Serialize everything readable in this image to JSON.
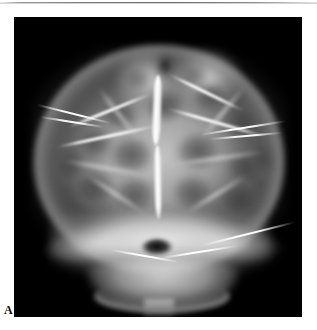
{
  "figure": {
    "panel_label": "A",
    "modality_icon": "xray-icon",
    "panel_background_color": "#000000",
    "page_background_color": "#ffffff",
    "rule_color": "#777777",
    "label_color": "#111111"
  },
  "image": {
    "name": "skull-radiograph",
    "view": "anteroposterior",
    "finding": "lacunar-skull",
    "panel_left_px": 14,
    "panel_top_px": 17,
    "panel_width_px": 288,
    "panel_height_px": 300
  },
  "anatomy": {
    "vault": {
      "name": "cranial-vault"
    },
    "vertex_bumps": {
      "name": "vertex-contour"
    },
    "lacunae": [
      {
        "name": "lacuna-right-upper-1",
        "x": 128,
        "y": 70,
        "w": 46,
        "h": 38,
        "rot": -8,
        "tone": 0.82
      },
      {
        "name": "lacuna-right-upper-2",
        "x": 174,
        "y": 62,
        "w": 44,
        "h": 36,
        "rot": 6,
        "tone": 0.8
      },
      {
        "name": "lacuna-right-lat-1",
        "x": 206,
        "y": 86,
        "w": 44,
        "h": 40,
        "rot": 14,
        "tone": 0.78
      },
      {
        "name": "lacuna-left-upper-1",
        "x": 84,
        "y": 80,
        "w": 44,
        "h": 36,
        "rot": 10,
        "tone": 0.78
      },
      {
        "name": "lacuna-left-upper-2",
        "x": 60,
        "y": 106,
        "w": 42,
        "h": 40,
        "rot": -6,
        "tone": 0.74
      },
      {
        "name": "lacuna-mid-left",
        "x": 92,
        "y": 116,
        "w": 52,
        "h": 44,
        "rot": 4,
        "tone": 0.84
      },
      {
        "name": "lacuna-mid-right",
        "x": 158,
        "y": 112,
        "w": 52,
        "h": 44,
        "rot": -4,
        "tone": 0.84
      },
      {
        "name": "lacuna-right-lat-2",
        "x": 208,
        "y": 128,
        "w": 46,
        "h": 44,
        "rot": -12,
        "tone": 0.8
      },
      {
        "name": "lacuna-left-lower-1",
        "x": 56,
        "y": 150,
        "w": 48,
        "h": 42,
        "rot": 8,
        "tone": 0.8
      },
      {
        "name": "lacuna-mid-low-left",
        "x": 96,
        "y": 156,
        "w": 50,
        "h": 44,
        "rot": -6,
        "tone": 0.8
      },
      {
        "name": "lacuna-mid-low-right",
        "x": 154,
        "y": 154,
        "w": 50,
        "h": 44,
        "rot": 6,
        "tone": 0.8
      },
      {
        "name": "lacuna-right-lower-1",
        "x": 200,
        "y": 160,
        "w": 48,
        "h": 42,
        "rot": -8,
        "tone": 0.78
      },
      {
        "name": "lacuna-left-temporal",
        "x": 38,
        "y": 124,
        "w": 36,
        "h": 46,
        "rot": 16,
        "tone": 0.66
      },
      {
        "name": "lacuna-right-temporal",
        "x": 232,
        "y": 118,
        "w": 34,
        "h": 46,
        "rot": -16,
        "tone": 0.64
      },
      {
        "name": "lacuna-vertex-left",
        "x": 108,
        "y": 48,
        "w": 34,
        "h": 28,
        "rot": 0,
        "tone": 0.6
      },
      {
        "name": "lacuna-vertex-right",
        "x": 164,
        "y": 46,
        "w": 34,
        "h": 28,
        "rot": 0,
        "tone": 0.58
      }
    ],
    "septa": [
      {
        "name": "septum-midline-upper",
        "x": 138,
        "y": 58,
        "w": 10,
        "h": 70,
        "rot": 2,
        "bright": true
      },
      {
        "name": "septum-midline-lower",
        "x": 140,
        "y": 128,
        "w": 8,
        "h": 74,
        "rot": -1,
        "bright": true
      },
      {
        "name": "septum-right-oblique-1",
        "x": 150,
        "y": 74,
        "w": 84,
        "h": 3,
        "rot": 26,
        "bright": true
      },
      {
        "name": "septum-right-oblique-2",
        "x": 150,
        "y": 104,
        "w": 104,
        "h": 3,
        "rot": 16,
        "bright": true
      },
      {
        "name": "septum-right-oblique-3",
        "x": 152,
        "y": 140,
        "w": 102,
        "h": 3,
        "rot": -8,
        "bright": false
      },
      {
        "name": "septum-left-oblique-1",
        "x": 50,
        "y": 92,
        "w": 92,
        "h": 3,
        "rot": -22,
        "bright": true
      },
      {
        "name": "septum-left-oblique-2",
        "x": 40,
        "y": 118,
        "w": 106,
        "h": 3,
        "rot": -12,
        "bright": true
      },
      {
        "name": "septum-left-oblique-3",
        "x": 44,
        "y": 150,
        "w": 100,
        "h": 3,
        "rot": 10,
        "bright": false
      },
      {
        "name": "septum-coronal-left",
        "x": 70,
        "y": 96,
        "w": 70,
        "h": 3,
        "rot": 52,
        "bright": false
      },
      {
        "name": "septum-coronal-right",
        "x": 174,
        "y": 94,
        "w": 70,
        "h": 3,
        "rot": -50,
        "bright": false
      },
      {
        "name": "septum-lambdoid-left",
        "x": 64,
        "y": 176,
        "w": 76,
        "h": 3,
        "rot": 34,
        "bright": false
      },
      {
        "name": "septum-lambdoid-right",
        "x": 164,
        "y": 176,
        "w": 76,
        "h": 3,
        "rot": -32,
        "bright": false
      }
    ],
    "base": {
      "name": "skull-base"
    },
    "foramen_magnum": {
      "name": "foramen-magnum"
    },
    "mandible": {
      "name": "mandible"
    },
    "spine": {
      "name": "cervical-spine"
    },
    "streaks": [
      {
        "name": "streak-left-upper",
        "x": 22,
        "y": 96,
        "w": 76,
        "rot": 14
      },
      {
        "name": "streak-left-upper-2",
        "x": 26,
        "y": 104,
        "w": 64,
        "rot": 9
      },
      {
        "name": "streak-right-upper",
        "x": 186,
        "y": 110,
        "w": 86,
        "rot": -9
      },
      {
        "name": "streak-right-upper-2",
        "x": 196,
        "y": 118,
        "w": 72,
        "rot": -5
      },
      {
        "name": "streak-right-lower",
        "x": 186,
        "y": 216,
        "w": 96,
        "rot": -14
      },
      {
        "name": "streak-base-left",
        "x": 96,
        "y": 238,
        "w": 70,
        "rot": 10
      },
      {
        "name": "streak-base-right",
        "x": 146,
        "y": 234,
        "w": 78,
        "rot": -9
      }
    ]
  }
}
